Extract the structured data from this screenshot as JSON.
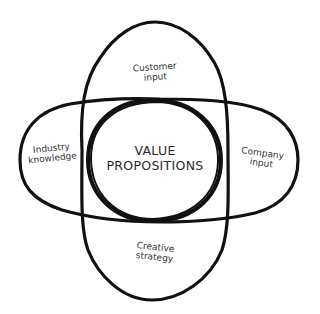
{
  "diagram": {
    "type": "venn",
    "stroke_color": "#111111",
    "background": "#ffffff",
    "center": {
      "line1": "VALUE",
      "line2": "PROPOSITIONS"
    },
    "regions": {
      "top": {
        "line1": "Customer",
        "line2": "input"
      },
      "left": {
        "line1": "Industry",
        "line2": "knowledge"
      },
      "right": {
        "line1": "Company",
        "line2": "input"
      },
      "bottom": {
        "line1": "Creative",
        "line2": "strategy"
      }
    }
  }
}
